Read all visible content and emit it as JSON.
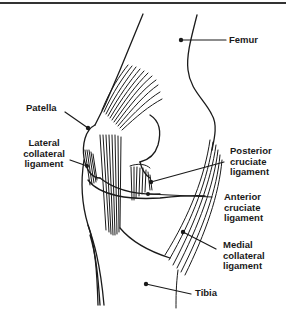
{
  "diagram": {
    "type": "anatomical-illustration",
    "labels": [
      {
        "id": "femur",
        "text": "Femur"
      },
      {
        "id": "patella",
        "text": "Patella"
      },
      {
        "id": "lateral-collateral-ligament",
        "text": "Lateral\ncollateral\nligament"
      },
      {
        "id": "posterior-cruciate-ligament",
        "text": "Posterior\ncruciate\nligament"
      },
      {
        "id": "anterior-cruciate-ligament",
        "text": "Anterior\ncruciate\nligament"
      },
      {
        "id": "medial-collateral-ligament",
        "text": "Medial\ncollateral\nligament"
      },
      {
        "id": "tibia",
        "text": "Tibia"
      }
    ],
    "colors": {
      "line": "#1a1a1a",
      "background": "#ffffff",
      "rule": "#333333"
    }
  }
}
